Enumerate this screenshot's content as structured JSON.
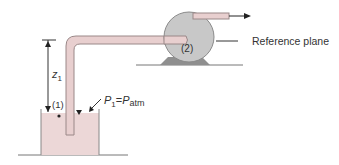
{
  "figure": {
    "labels": {
      "point_1": "(1)",
      "point_2": "(2)",
      "height": {
        "symbol": "z",
        "subscript": "1"
      },
      "pressure": {
        "lhs": "P",
        "lhs_sub": "1",
        "eq": "=",
        "rhs": "P",
        "rhs_sub": "atm"
      },
      "reference_plane": "Reference plane"
    },
    "colors": {
      "liquid": "#ecd7d7",
      "pipe_fill": "#e8cfcf",
      "pipe_stroke": "#9a8888",
      "pump_fill": "#c8c8c8",
      "pump_stroke": "#8a8a8a",
      "base_fill": "#8f8f8f",
      "line": "#555555"
    }
  }
}
